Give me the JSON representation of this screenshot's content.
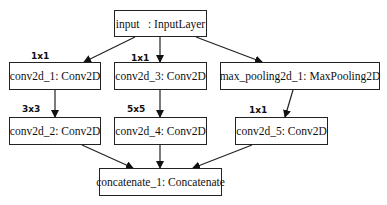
{
  "nodes": {
    "input": {
      "label": "input   : InputLayer"
    },
    "conv2d_1": {
      "label": "conv2d_1: Conv2D"
    },
    "conv2d_3": {
      "label": "conv2d_3: Conv2D"
    },
    "max_pooling2d_1": {
      "label": "max_pooling2d_1: MaxPooling2D"
    },
    "conv2d_2": {
      "label": "conv2d_2: Conv2D"
    },
    "conv2d_4": {
      "label": "conv2d_4: Conv2D"
    },
    "conv2d_5": {
      "label": "conv2d_5: Conv2D"
    },
    "concatenate_1": {
      "label": "concatenate_1: Concatenate"
    }
  },
  "edge_labels": {
    "conv2d_1": "1x1",
    "conv2d_3": "1x1",
    "conv2d_2": "3x3",
    "conv2d_4": "5x5",
    "conv2d_5": "1x1"
  },
  "edges": [
    [
      "input",
      "conv2d_1"
    ],
    [
      "input",
      "conv2d_3"
    ],
    [
      "input",
      "max_pooling2d_1"
    ],
    [
      "conv2d_1",
      "conv2d_2"
    ],
    [
      "conv2d_3",
      "conv2d_4"
    ],
    [
      "max_pooling2d_1",
      "conv2d_5"
    ],
    [
      "conv2d_2",
      "concatenate_1"
    ],
    [
      "conv2d_4",
      "concatenate_1"
    ],
    [
      "conv2d_5",
      "concatenate_1"
    ]
  ]
}
